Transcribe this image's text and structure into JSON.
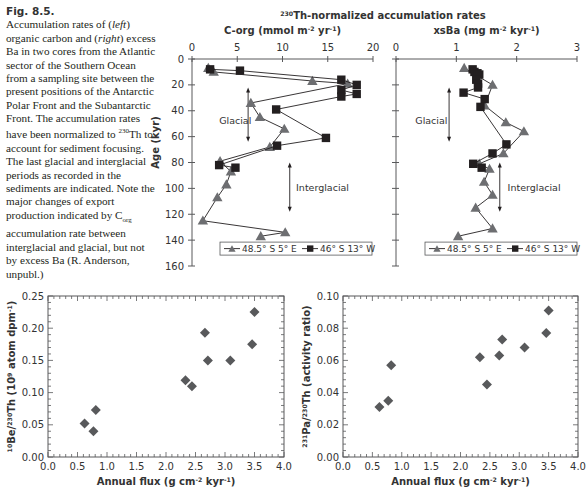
{
  "caption": {
    "figure_label": "Fig. 8.5.",
    "text_parts": [
      "Accumulation rates of (",
      "left",
      ") organic carbon and (",
      "right",
      ") excess Ba in two cores from the Atlantic sector of the Southern Ocean from a sampling site between the present positions of the Antarctic Polar Front and the Subantarctic Front. The accumulation rates have been normalized to ",
      "230",
      "Th to account for sediment focusing. The last glacial and interglacial periods as recorded in the sediments are indicated. Note the major changes of export production indicated by C",
      "org",
      " accumulation rate between interglacial and glacial, but not by excess Ba (R. Anderson, unpubl.)"
    ]
  },
  "colors": {
    "triangle": "#6d6e71",
    "square": "#231f20",
    "diamond": "#58595b",
    "axis": "#58595b"
  },
  "chart_data": [
    {
      "id": "corg",
      "type": "line",
      "supertitle": "230Th-normalized accumulation rates",
      "supertitle_sup": "230",
      "supertitle_main": "Th-normalized accumulation rates",
      "title": "C-org (mmol m-2 yr-1)",
      "title_parts": [
        "C-org (mmol m",
        "-2",
        " yr",
        "-1",
        ")"
      ],
      "ylabel": "Age (kyr)",
      "xlim": [
        0,
        20
      ],
      "ylim": [
        0,
        160
      ],
      "x_ticks": [
        "0",
        "5",
        "10",
        "15",
        "20"
      ],
      "y_ticks": [
        "0",
        "20",
        "40",
        "60",
        "80",
        "100",
        "120",
        "140",
        "160"
      ],
      "y_inverted": true,
      "x_axis_position": "top",
      "annotations": [
        {
          "text": "Glacial",
          "x": 3.0,
          "y": 48,
          "arrow_from": 22,
          "arrow_to": 64,
          "arrow_x": 6.2
        },
        {
          "text": "Interglacial",
          "x": 11.5,
          "y": 100,
          "arrow_from": 80,
          "arrow_to": 118,
          "arrow_x": 10.8
        }
      ],
      "legend": {
        "placement": "bottom",
        "entries": [
          "48.5° S  5° E",
          "46° S  13° W"
        ]
      },
      "series": [
        {
          "name": "48.5° S  5° E",
          "marker": "triangle",
          "points": [
            [
              1.8,
              7
            ],
            [
              2.4,
              10
            ],
            [
              13.3,
              17
            ],
            [
              17.2,
              19
            ],
            [
              6.5,
              34
            ],
            [
              7.5,
              45
            ],
            [
              10.2,
              54
            ],
            [
              8.6,
              68
            ],
            [
              3.1,
              79
            ],
            [
              4.3,
              87
            ],
            [
              3.8,
              97
            ],
            [
              2.8,
              107
            ],
            [
              1.2,
              125
            ],
            [
              10.3,
              134
            ],
            [
              7.6,
              137
            ]
          ]
        },
        {
          "name": "46° S  13° W",
          "marker": "square",
          "points": [
            [
              2.0,
              8
            ],
            [
              5.3,
              9
            ],
            [
              16.5,
              16
            ],
            [
              18.2,
              20
            ],
            [
              16.5,
              24
            ],
            [
              18.2,
              27
            ],
            [
              16.5,
              29
            ],
            [
              9.3,
              39
            ],
            [
              14.8,
              61
            ],
            [
              9.4,
              67
            ],
            [
              3.0,
              82
            ],
            [
              4.8,
              84
            ]
          ]
        }
      ]
    },
    {
      "id": "xsba",
      "type": "line",
      "title": "xsBa (mg m-2 kyr-1)",
      "title_parts": [
        "xsBa (mg m",
        "-2",
        " kyr",
        "-1",
        ")"
      ],
      "xlim": [
        0,
        3
      ],
      "ylim": [
        0,
        160
      ],
      "x_ticks": [
        "0",
        "1",
        "2",
        "3"
      ],
      "y_inverted": true,
      "x_axis_position": "top",
      "annotations": [
        {
          "text": "Glacial",
          "x": 0.32,
          "y": 48,
          "arrow_from": 22,
          "arrow_to": 64,
          "arrow_x": 0.88
        },
        {
          "text": "Interglacial",
          "x": 1.85,
          "y": 100,
          "arrow_from": 80,
          "arrow_to": 118,
          "arrow_x": 1.72
        }
      ],
      "legend": {
        "placement": "bottom",
        "entries": [
          "48.5° S  5° E",
          "46° S  13° W"
        ]
      },
      "series": [
        {
          "name": "48.5° S  5° E",
          "marker": "triangle",
          "points": [
            [
              1.13,
              7
            ],
            [
              1.6,
              20
            ],
            [
              1.47,
              36
            ],
            [
              1.82,
              49
            ],
            [
              2.12,
              56
            ],
            [
              1.78,
              73
            ],
            [
              1.38,
              81
            ],
            [
              1.55,
              85
            ],
            [
              1.46,
              95
            ],
            [
              1.6,
              105
            ],
            [
              1.32,
              115
            ],
            [
              1.6,
              131
            ],
            [
              1.03,
              137
            ]
          ]
        },
        {
          "name": "46° S  13° W",
          "marker": "square",
          "points": [
            [
              1.27,
              8
            ],
            [
              1.3,
              10
            ],
            [
              1.35,
              11
            ],
            [
              1.38,
              12
            ],
            [
              1.33,
              16
            ],
            [
              1.36,
              19
            ],
            [
              1.36,
              22
            ],
            [
              1.12,
              26
            ],
            [
              1.47,
              31
            ],
            [
              1.4,
              37
            ],
            [
              1.83,
              66
            ],
            [
              1.6,
              73
            ],
            [
              1.28,
              81
            ],
            [
              1.42,
              84
            ]
          ]
        }
      ]
    },
    {
      "id": "be-th",
      "type": "scatter",
      "xlabel": "Annual flux (g cm-2 kyr-1)",
      "xlabel_parts": [
        "Annual flux (g cm",
        "-2",
        " kyr",
        "-1",
        ")"
      ],
      "ylabel": "10Be/230Th (10^9 atom dpm-1)",
      "ylabel_parts": [
        "10",
        "Be/",
        "230",
        "Th (10",
        "9",
        " atom dpm",
        "-1",
        ")"
      ],
      "xlim": [
        0,
        4
      ],
      "ylim": [
        0,
        0.25
      ],
      "x_ticks": [
        "0.0",
        "0.5",
        "1.0",
        "1.5",
        "2.0",
        "2.5",
        "3.0",
        "3.5",
        "4.0"
      ],
      "y_ticks": [
        "0.00",
        "0.05",
        "0.10",
        "0.15",
        "0.20",
        "0.25"
      ],
      "marker": "diamond",
      "points": [
        [
          0.62,
          0.052
        ],
        [
          0.77,
          0.04
        ],
        [
          0.81,
          0.073
        ],
        [
          2.33,
          0.119
        ],
        [
          2.44,
          0.11
        ],
        [
          2.66,
          0.193
        ],
        [
          2.71,
          0.15
        ],
        [
          3.09,
          0.15
        ],
        [
          3.46,
          0.175
        ],
        [
          3.5,
          0.225
        ]
      ]
    },
    {
      "id": "pa-th",
      "type": "scatter",
      "xlabel": "Annual flux (g cm-2 kyr-1)",
      "xlabel_parts": [
        "Annual flux (g cm",
        "-2",
        " kyr",
        "-1",
        ")"
      ],
      "ylabel": "231Pa/230Th (activity ratio)",
      "ylabel_parts": [
        "231",
        "Pa/",
        "230",
        "Th (activity ratio)"
      ],
      "xlim": [
        0,
        4
      ],
      "ylim": [
        0,
        0.1
      ],
      "x_ticks": [
        "0.0",
        "0.5",
        "1.0",
        "1.5",
        "2.0",
        "2.5",
        "3.0",
        "3.5",
        "4.0"
      ],
      "y_ticks": [
        "0.00",
        "0.02",
        "0.04",
        "0.06",
        "0.08",
        "0.10"
      ],
      "marker": "diamond",
      "points": [
        [
          0.62,
          0.031
        ],
        [
          0.77,
          0.035
        ],
        [
          0.82,
          0.057
        ],
        [
          2.33,
          0.062
        ],
        [
          2.45,
          0.045
        ],
        [
          2.66,
          0.063
        ],
        [
          2.71,
          0.073
        ],
        [
          3.09,
          0.068
        ],
        [
          3.46,
          0.077
        ],
        [
          3.5,
          0.091
        ]
      ]
    }
  ]
}
